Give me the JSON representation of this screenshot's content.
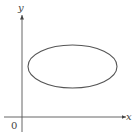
{
  "diagram": {
    "x_axis_label": "x",
    "y_axis_label": "y",
    "origin_label": "0",
    "shape": "ellipse",
    "colors": {
      "stroke": "#555555",
      "background": "#ffffff"
    }
  }
}
